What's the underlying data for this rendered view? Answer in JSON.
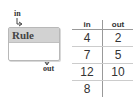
{
  "machine": {
    "input_label": "in",
    "output_label": "out",
    "rule_label": "Rule"
  },
  "table": {
    "headers": [
      "in",
      "out"
    ],
    "rows": [
      [
        "4",
        "2"
      ],
      [
        "7",
        "5"
      ],
      [
        "12",
        "10"
      ],
      [
        "8",
        ""
      ]
    ]
  }
}
